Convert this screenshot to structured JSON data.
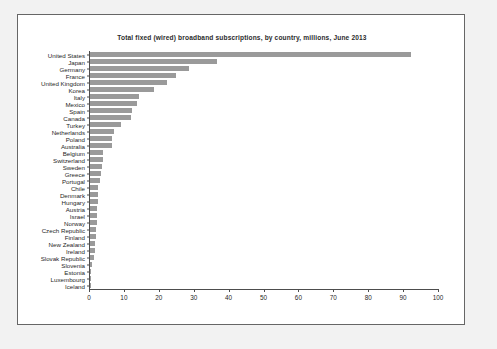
{
  "chart_data": {
    "type": "bar",
    "orientation": "horizontal",
    "title": "Total  fixed (wired) broadband subscriptions, by country, millions,   June 2013",
    "xlabel": "",
    "ylabel": "",
    "xlim": [
      0,
      100
    ],
    "xticks": [
      0,
      10,
      20,
      30,
      40,
      50,
      60,
      70,
      80,
      90,
      100
    ],
    "grid": false,
    "legend": null,
    "bar_color": "#9a9a9a",
    "categories": [
      "United States",
      "Japan",
      "Germany",
      "France",
      "United Kingdom",
      "Korea",
      "Italy",
      "Mexico",
      "Spain",
      "Canada",
      "Turkey",
      "Netherlands",
      "Poland",
      "Australia",
      "Belgium",
      "Switzerland",
      "Sweden",
      "Greece",
      "Portugal",
      "Chile",
      "Denmark",
      "Hungary",
      "Austria",
      "Israel",
      "Norway",
      "Czech Republic",
      "Finland",
      "New Zealand",
      "Ireland",
      "Slovak Republic",
      "Slovenia",
      "Estonia",
      "Luxembourg",
      "Iceland"
    ],
    "values": [
      92.0,
      36.5,
      28.5,
      24.5,
      22.0,
      18.3,
      14.0,
      13.5,
      12.0,
      11.8,
      9.0,
      6.8,
      6.3,
      6.2,
      3.8,
      3.6,
      3.3,
      3.1,
      2.8,
      2.4,
      2.3,
      2.2,
      2.1,
      2.0,
      1.9,
      1.7,
      1.6,
      1.4,
      1.3,
      1.1,
      0.6,
      0.4,
      0.2,
      0.1
    ]
  },
  "xtick_labels": [
    "0",
    "10",
    "20",
    "30",
    "40",
    "50",
    "60",
    "70",
    "80",
    "90",
    "100"
  ]
}
